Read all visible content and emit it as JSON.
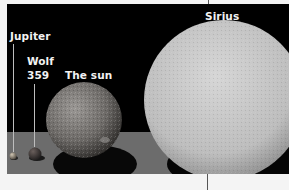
{
  "figure": {
    "labels": {
      "jupiter": "Jupiter",
      "wolf_line1": "Wolf",
      "wolf_line2": "359",
      "sun": "The sun",
      "sirius": "Sirius"
    },
    "bodies": [
      {
        "name": "Jupiter",
        "relative_size": "smallest",
        "color": "#8a8070"
      },
      {
        "name": "Wolf 359",
        "relative_size": "small",
        "color": "#3a3636"
      },
      {
        "name": "The sun",
        "relative_size": "medium",
        "color": "#7a7775"
      },
      {
        "name": "Sirius",
        "relative_size": "largest",
        "color": "#c8c8c8"
      }
    ],
    "colors": {
      "background": "#000000",
      "floor": "#6e6e6e",
      "shadow": "#0a0a0a",
      "page": "#f4f4f4",
      "label": "#f2f2f2"
    }
  }
}
